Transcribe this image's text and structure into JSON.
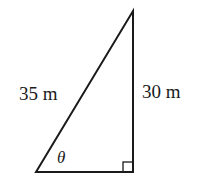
{
  "diagram": {
    "type": "right-triangle",
    "hypotenuse_label": "35 m",
    "vertical_side_label": "30 m",
    "angle_label": "θ",
    "right_angle_marker": true,
    "colors": {
      "stroke": "#1a1a1a",
      "background": "#ffffff"
    }
  }
}
